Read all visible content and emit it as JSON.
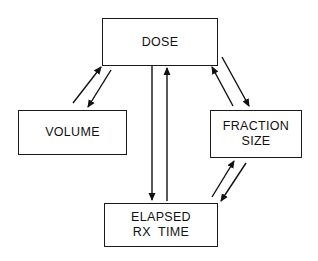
{
  "diagram": {
    "nodes": {
      "dose": {
        "lines": [
          "DOSE"
        ]
      },
      "volume": {
        "lines": [
          "VOLUME"
        ]
      },
      "fraction_size": {
        "lines": [
          "FRACTION",
          "SIZE"
        ]
      },
      "elapsed_rx_time": {
        "lines": [
          "ELAPSED",
          "RX  TIME"
        ]
      }
    },
    "edges": [
      {
        "from": "volume",
        "to": "dose"
      },
      {
        "from": "dose",
        "to": "volume"
      },
      {
        "from": "dose",
        "to": "elapsed_rx_time"
      },
      {
        "from": "elapsed_rx_time",
        "to": "dose"
      },
      {
        "from": "fraction_size",
        "to": "dose"
      },
      {
        "from": "dose",
        "to": "fraction_size"
      },
      {
        "from": "elapsed_rx_time",
        "to": "fraction_size"
      },
      {
        "from": "fraction_size",
        "to": "elapsed_rx_time"
      }
    ],
    "colors": {
      "stroke": "#111111",
      "background": "#ffffff"
    }
  }
}
